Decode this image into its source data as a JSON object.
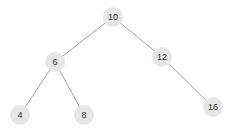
{
  "tree": {
    "colors": {
      "node_fill": "#e6e6e6",
      "edge": "#888888",
      "text": "#333333"
    },
    "nodes": [
      {
        "id": "n10",
        "label": "10",
        "x": 113,
        "y": 17
      },
      {
        "id": "n6",
        "label": "6",
        "x": 55,
        "y": 62
      },
      {
        "id": "n12",
        "label": "12",
        "x": 162,
        "y": 57
      },
      {
        "id": "n4",
        "label": "4",
        "x": 20,
        "y": 115
      },
      {
        "id": "n8",
        "label": "8",
        "x": 84,
        "y": 115
      },
      {
        "id": "n16",
        "label": "16",
        "x": 213,
        "y": 107
      }
    ],
    "edges": [
      {
        "from": "10",
        "to": "6"
      },
      {
        "from": "10",
        "to": "12"
      },
      {
        "from": "6",
        "to": "4"
      },
      {
        "from": "6",
        "to": "8"
      },
      {
        "from": "12",
        "to": "16"
      }
    ]
  }
}
